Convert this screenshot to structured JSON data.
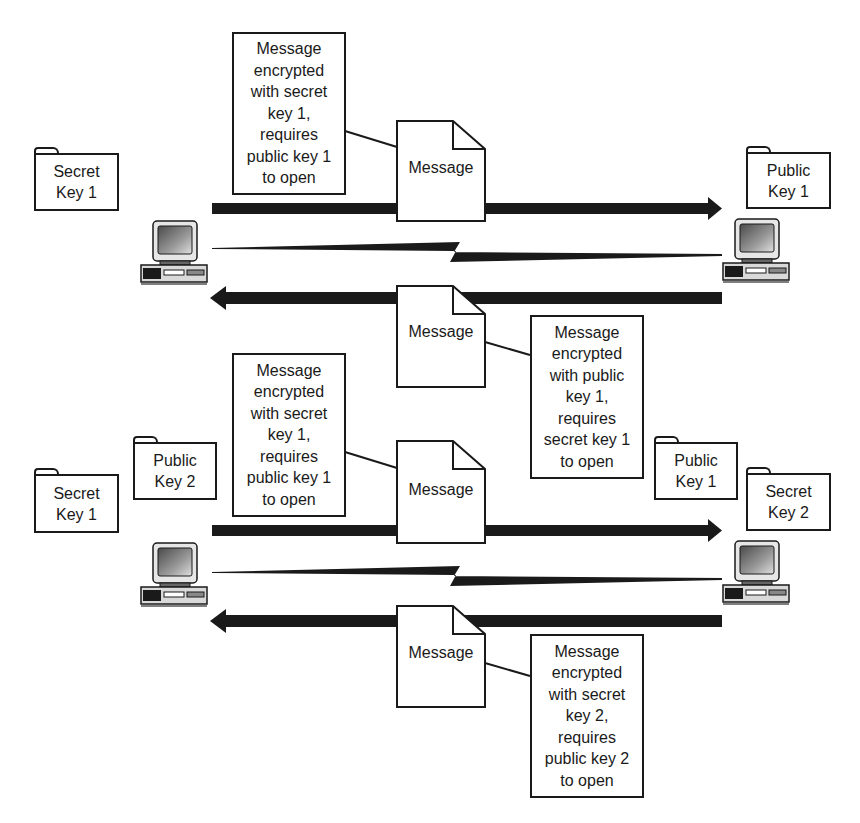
{
  "diagram": {
    "top_scenario": {
      "left_computer": {
        "keys": [
          {
            "label_line1": "Secret",
            "label_line2": "Key 1"
          }
        ]
      },
      "right_computer": {
        "keys": [
          {
            "label_line1": "Public",
            "label_line2": "Key 1"
          }
        ]
      },
      "outgoing": {
        "direction": "left-to-right",
        "document_label": "Message",
        "callout_lines": [
          "Message",
          "encrypted",
          "with secret",
          "key 1,",
          "requires",
          "public key 1",
          "to open"
        ]
      },
      "return": {
        "direction": "right-to-left",
        "document_label": "Message",
        "callout_lines": [
          "Message",
          "encrypted",
          "with public",
          "key 1,",
          "requires",
          "secret key 1",
          "to open"
        ]
      }
    },
    "bottom_scenario": {
      "left_computer": {
        "keys": [
          {
            "label_line1": "Secret",
            "label_line2": "Key 1"
          },
          {
            "label_line1": "Public",
            "label_line2": "Key 2"
          }
        ]
      },
      "right_computer": {
        "keys": [
          {
            "label_line1": "Public",
            "label_line2": "Key 1"
          },
          {
            "label_line1": "Secret",
            "label_line2": "Key 2"
          }
        ]
      },
      "outgoing": {
        "direction": "left-to-right",
        "document_label": "Message",
        "callout_lines": [
          "Message",
          "encrypted",
          "with secret",
          "key 1,",
          "requires",
          "public key 1",
          "to open"
        ]
      },
      "return": {
        "direction": "right-to-left",
        "document_label": "Message",
        "callout_lines": [
          "Message",
          "encrypted",
          "with secret",
          "key 2,",
          "requires",
          "public key 2",
          "to open"
        ]
      }
    },
    "icons": {
      "computer": "desktop-computer-icon",
      "key_holder": "folder-icon",
      "document": "document-icon",
      "link": "lightning-link-icon"
    },
    "colors": {
      "ink": "#1a1a1a",
      "background": "#ffffff"
    }
  }
}
